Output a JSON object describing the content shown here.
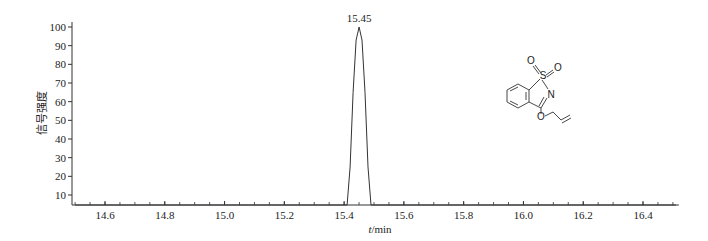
{
  "chart_data": {
    "type": "line",
    "title": "",
    "xlabel": "t/min",
    "xlabel_italic_part": "t",
    "xlabel_unit_part": "/min",
    "ylabel": "信号强度",
    "xlim": [
      14.5,
      16.52
    ],
    "ylim": [
      4,
      100
    ],
    "x_ticks": [
      14.6,
      14.8,
      15.0,
      15.2,
      15.4,
      15.6,
      15.8,
      16.0,
      16.2,
      16.4
    ],
    "x_tick_labels": [
      "14.6",
      "14.8",
      "15.0",
      "15.2",
      "15.4",
      "15.6",
      "15.8",
      "16.0",
      "16.2",
      "16.4"
    ],
    "x_minor_step": 0.05,
    "y_ticks": [
      10,
      20,
      30,
      40,
      50,
      60,
      70,
      80,
      90,
      100
    ],
    "y_tick_labels": [
      "10",
      "20",
      "30",
      "40",
      "50",
      "60",
      "70",
      "80",
      "90",
      "100"
    ],
    "grid": false,
    "legend": null,
    "series": [
      {
        "name": "chromatogram",
        "peak": {
          "retention_time": 15.45,
          "height": 100,
          "start": 15.41,
          "end": 15.49
        },
        "x": [
          14.5,
          15.41,
          15.42,
          15.43,
          15.44,
          15.45,
          15.46,
          15.47,
          15.48,
          15.49,
          16.52
        ],
        "y": [
          4,
          4,
          25,
          65,
          93,
          100,
          93,
          65,
          25,
          4,
          4
        ]
      }
    ],
    "annotations": [
      {
        "text": "15.45",
        "x": 15.45,
        "y": 100,
        "position": "above-peak"
      }
    ],
    "inset": {
      "type": "chemical-structure",
      "description": "3-(allyloxy)-1,2-benzisothiazole 1,1-dioxide",
      "atom_labels": [
        "S",
        "O",
        "O",
        "N",
        "O"
      ]
    }
  }
}
